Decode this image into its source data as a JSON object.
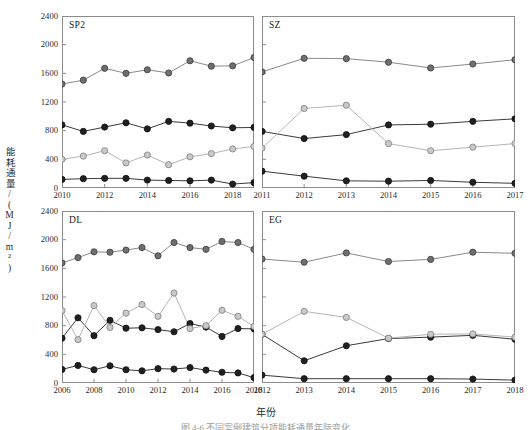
{
  "figure": {
    "ylabel": "能耗通量/(MJ/m²)",
    "xlabel": "年份",
    "caption": "图 4-6  不同案例建筑分项能耗通量年际变化"
  },
  "axis": {
    "y_ticks": [
      "0",
      "400",
      "800",
      "1200",
      "1600",
      "2000",
      "2400"
    ],
    "y_min": 0,
    "y_max": 2400
  },
  "colors": {
    "series_total": "#707070",
    "series_hvac": "#232323",
    "series_light": "#b8b8b8",
    "series_other": "#232323",
    "axis": "#8c8c8c",
    "frame": "#8c8c8c",
    "text": "#1a1a1a"
  },
  "chart_data": [
    {
      "type": "line",
      "title": "SP2",
      "xlabel": "年份",
      "ylabel": "能耗通量/(MJ/m²)",
      "ylim": [
        0,
        2400
      ],
      "xlim": [
        2010,
        2019
      ],
      "grid": false,
      "legend": "none",
      "x": [
        2010,
        2011,
        2012,
        2013,
        2014,
        2015,
        2016,
        2017,
        2018,
        2019
      ],
      "xticks": [
        "2010",
        "2012",
        "2014",
        "2016",
        "2018"
      ],
      "xtick_values": [
        2010,
        2012,
        2014,
        2016,
        2018
      ],
      "series": [
        {
          "name": "总能耗",
          "marker": "circle-dark-gray",
          "values": [
            1450,
            1505,
            1670,
            1600,
            1650,
            1605,
            1775,
            1700,
            1705,
            1820
          ]
        },
        {
          "name": "空调能耗",
          "marker": "circle-black",
          "values": [
            880,
            790,
            850,
            910,
            825,
            930,
            905,
            865,
            840,
            845
          ]
        },
        {
          "name": "照明能耗",
          "marker": "circle-light-gray",
          "values": [
            400,
            445,
            520,
            350,
            460,
            325,
            435,
            480,
            545,
            580
          ]
        },
        {
          "name": "其他能耗",
          "marker": "circle-black",
          "values": [
            120,
            130,
            135,
            135,
            110,
            105,
            100,
            110,
            55,
            75
          ]
        }
      ]
    },
    {
      "type": "line",
      "title": "SZ",
      "xlabel": "年份",
      "ylabel": "能耗通量/(MJ/m²)",
      "ylim": [
        0,
        2400
      ],
      "xlim": [
        2011,
        2017
      ],
      "grid": false,
      "legend": "none",
      "x": [
        2011,
        2012,
        2013,
        2014,
        2015,
        2016,
        2017
      ],
      "xticks": [
        "2011",
        "2012",
        "2013",
        "2014",
        "2015",
        "2016",
        "2017"
      ],
      "xtick_values": [
        2011,
        2012,
        2013,
        2014,
        2015,
        2016,
        2017
      ],
      "series": [
        {
          "name": "总能耗",
          "marker": "circle-dark-gray",
          "values": [
            1620,
            1810,
            1805,
            1755,
            1675,
            1730,
            1790
          ]
        },
        {
          "name": "空调能耗",
          "marker": "circle-black",
          "values": [
            790,
            690,
            745,
            880,
            890,
            930,
            965
          ]
        },
        {
          "name": "照明能耗",
          "marker": "circle-light-gray",
          "values": [
            555,
            1110,
            1155,
            620,
            520,
            570,
            620
          ]
        },
        {
          "name": "其他能耗",
          "marker": "circle-black",
          "values": [
            235,
            165,
            100,
            95,
            105,
            80,
            65
          ]
        }
      ]
    },
    {
      "type": "line",
      "title": "DL",
      "xlabel": "年份",
      "ylabel": "能耗通量/(MJ/m²)",
      "ylim": [
        0,
        2400
      ],
      "xlim": [
        2006,
        2018
      ],
      "grid": false,
      "legend": "none",
      "x": [
        2006,
        2007,
        2008,
        2009,
        2010,
        2011,
        2012,
        2013,
        2014,
        2015,
        2016,
        2017,
        2018
      ],
      "xticks": [
        "2006",
        "2008",
        "2010",
        "2012",
        "2014",
        "2016",
        "2018"
      ],
      "xtick_values": [
        2006,
        2008,
        2010,
        2012,
        2014,
        2016,
        2018
      ],
      "series": [
        {
          "name": "总能耗",
          "marker": "circle-dark-gray",
          "values": [
            1675,
            1750,
            1830,
            1825,
            1855,
            1890,
            1775,
            1960,
            1890,
            1865,
            1975,
            1960,
            1865
          ]
        },
        {
          "name": "空调能耗",
          "marker": "circle-black",
          "values": [
            625,
            910,
            660,
            875,
            765,
            770,
            745,
            715,
            830,
            780,
            650,
            760,
            755
          ]
        },
        {
          "name": "照明能耗",
          "marker": "circle-light-gray",
          "values": [
            1010,
            605,
            1080,
            775,
            975,
            1095,
            930,
            1255,
            760,
            800,
            1015,
            930,
            790
          ]
        },
        {
          "name": "其他能耗",
          "marker": "circle-black",
          "values": [
            190,
            245,
            185,
            240,
            185,
            170,
            200,
            195,
            215,
            180,
            150,
            140,
            75
          ]
        }
      ]
    },
    {
      "type": "line",
      "title": "EG",
      "xlabel": "年份",
      "ylabel": "能耗通量/(MJ/m²)",
      "ylim": [
        0,
        2400
      ],
      "xlim": [
        2012,
        2018
      ],
      "grid": false,
      "legend": "none",
      "x": [
        2012,
        2013,
        2014,
        2015,
        2016,
        2017,
        2018
      ],
      "xticks": [
        "2012",
        "2013",
        "2014",
        "2015",
        "2016",
        "2017",
        "2018"
      ],
      "xtick_values": [
        2012,
        2013,
        2014,
        2015,
        2016,
        2017,
        2018
      ],
      "series": [
        {
          "name": "总能耗",
          "marker": "circle-dark-gray",
          "values": [
            1730,
            1685,
            1815,
            1695,
            1725,
            1825,
            1810
          ]
        },
        {
          "name": "空调能耗",
          "marker": "circle-black",
          "values": [
            680,
            310,
            520,
            620,
            640,
            665,
            610
          ]
        },
        {
          "name": "照明能耗",
          "marker": "circle-light-gray",
          "values": [
            680,
            1000,
            915,
            625,
            680,
            685,
            640
          ]
        },
        {
          "name": "其他能耗",
          "marker": "circle-black",
          "values": [
            110,
            60,
            60,
            60,
            60,
            55,
            40
          ]
        }
      ]
    }
  ]
}
